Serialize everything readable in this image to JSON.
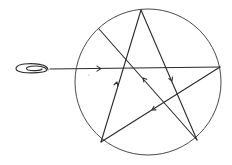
{
  "diagram": {
    "colors": {
      "background": "#ffffff",
      "line": "#2a2a2a",
      "circle": "#4a4a4a"
    },
    "circle": {
      "cx": 148,
      "cy": 82,
      "r": 73
    },
    "vertices": {
      "top": [
        141,
        10
      ],
      "upper_left": [
        99,
        29
      ],
      "right": [
        220,
        67
      ],
      "bottom_left": [
        101,
        142
      ],
      "bottom_right": [
        197,
        140
      ]
    },
    "coil": {
      "x": 16,
      "y": 64,
      "width": 32,
      "height": 9
    },
    "ray": {
      "start": [
        50,
        69
      ],
      "end": [
        220,
        67
      ]
    },
    "arrows": [
      {
        "at": [
          101,
          68.5
        ],
        "direction": "right"
      },
      {
        "at": [
          117,
          82
        ],
        "direction": "up"
      },
      {
        "at": [
          143,
          78
        ],
        "direction": "up-left"
      },
      {
        "at": [
          172,
          81
        ],
        "direction": "down"
      },
      {
        "at": [
          152,
          111
        ],
        "direction": "down-left"
      }
    ],
    "labels": []
  }
}
